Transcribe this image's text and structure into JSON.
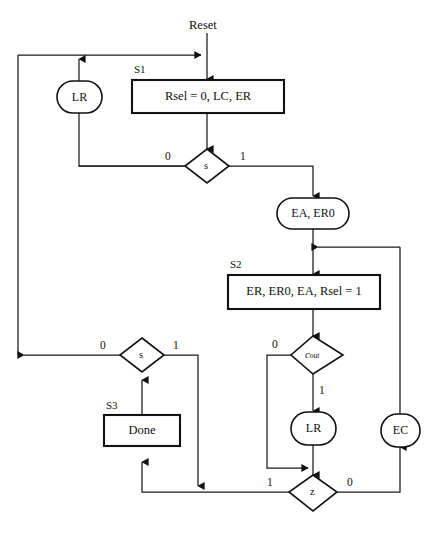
{
  "diagram": {
    "title_label": "Reset",
    "nodes": {
      "s1_state": "S1",
      "s1_box": "Rsel = 0, LC, ER",
      "lr_top": "LR",
      "s_diamond_top": "s",
      "ea_er0_oval": "EA, ER0",
      "s2_state": "S2",
      "s2_box": "ER, ER0, EA, Rsel = 1",
      "cout_diamond": "c",
      "cout_subscript": "out",
      "s_diamond_left": "s",
      "s3_state": "S3",
      "s3_box": "Done",
      "lr_mid": "LR",
      "ec_oval": "EC",
      "z_diamond": "z"
    },
    "branches": {
      "top_s_zero": "0",
      "top_s_one": "1",
      "cout_zero": "0",
      "cout_one": "1",
      "left_s_zero": "0",
      "left_s_one": "1",
      "z_one": "1",
      "z_zero": "0"
    },
    "colors": {
      "line": "#1a1a1a",
      "shape_stroke": "#111111",
      "fill": "#ffffff",
      "text": "#111111"
    }
  }
}
